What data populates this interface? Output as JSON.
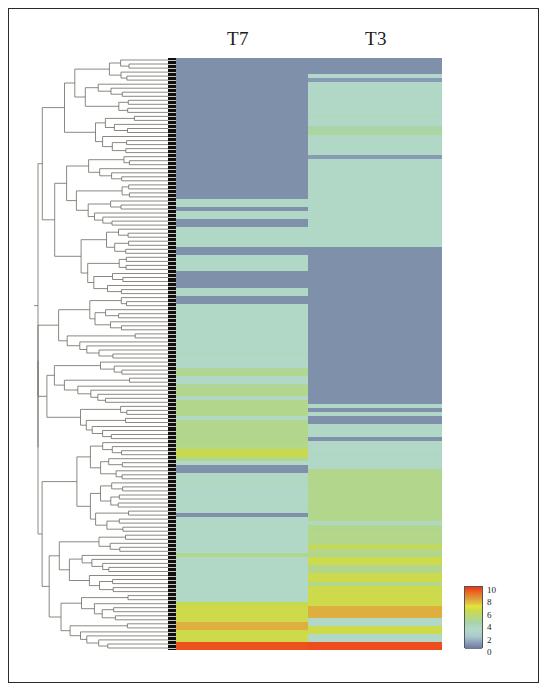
{
  "figure": {
    "type": "heatmap-with-dendrogram",
    "columns": [
      {
        "id": "t7",
        "label": "T7"
      },
      {
        "id": "t3",
        "label": "T3"
      }
    ]
  },
  "legend": {
    "title": "",
    "ticks": [
      "10",
      "8",
      "6",
      "4",
      "2",
      "0"
    ],
    "min": 0,
    "max": 10,
    "colors": [
      "#f03b18",
      "#f36a1e",
      "#e8962c",
      "#dcc33f",
      "#c9d94e",
      "#a9d48a",
      "#a8d9c6",
      "#b9dcd4",
      "#8fa2ba",
      "#6b7a99"
    ]
  },
  "chart_data": {
    "type": "heatmap",
    "title": "",
    "xlabel": "",
    "ylabel": "",
    "categories": [
      "T7",
      "T3"
    ],
    "colorbar": {
      "label": "",
      "min": 0,
      "max": 10,
      "ticks": [
        10,
        8,
        6,
        4,
        2,
        0
      ]
    },
    "grid": false,
    "legend_position": "bottom-right",
    "row_count": 148,
    "rows": [
      {
        "t7": 0.6,
        "t3": 0.6
      },
      {
        "t7": 0.6,
        "t3": 0.6
      },
      {
        "t7": 0.6,
        "t3": 0.6
      },
      {
        "t7": 0.6,
        "t3": 0.6
      },
      {
        "t7": 0.6,
        "t3": 3.0
      },
      {
        "t7": 0.6,
        "t3": 0.9
      },
      {
        "t7": 0.6,
        "t3": 3.2
      },
      {
        "t7": 0.6,
        "t3": 3.2
      },
      {
        "t7": 0.6,
        "t3": 3.2
      },
      {
        "t7": 0.6,
        "t3": 3.2
      },
      {
        "t7": 0.6,
        "t3": 3.2
      },
      {
        "t7": 0.6,
        "t3": 3.2
      },
      {
        "t7": 0.6,
        "t3": 3.2
      },
      {
        "t7": 0.6,
        "t3": 3.2
      },
      {
        "t7": 0.6,
        "t3": 3.4
      },
      {
        "t7": 0.6,
        "t3": 3.2
      },
      {
        "t7": 0.6,
        "t3": 3.2
      },
      {
        "t7": 0.6,
        "t3": 4.2
      },
      {
        "t7": 0.6,
        "t3": 4.4
      },
      {
        "t7": 0.6,
        "t3": 3.2
      },
      {
        "t7": 0.6,
        "t3": 3.2
      },
      {
        "t7": 0.6,
        "t3": 3.2
      },
      {
        "t7": 0.6,
        "t3": 3.2
      },
      {
        "t7": 0.6,
        "t3": 3.2
      },
      {
        "t7": 0.6,
        "t3": 0.9
      },
      {
        "t7": 0.6,
        "t3": 3.2
      },
      {
        "t7": 0.6,
        "t3": 3.2
      },
      {
        "t7": 0.6,
        "t3": 3.2
      },
      {
        "t7": 0.6,
        "t3": 3.2
      },
      {
        "t7": 0.6,
        "t3": 3.2
      },
      {
        "t7": 0.6,
        "t3": 3.2
      },
      {
        "t7": 0.6,
        "t3": 3.2
      },
      {
        "t7": 0.6,
        "t3": 3.2
      },
      {
        "t7": 0.6,
        "t3": 3.2
      },
      {
        "t7": 0.6,
        "t3": 3.2
      },
      {
        "t7": 3.2,
        "t3": 3.2
      },
      {
        "t7": 3.2,
        "t3": 3.2
      },
      {
        "t7": 0.6,
        "t3": 3.2
      },
      {
        "t7": 3.2,
        "t3": 3.2
      },
      {
        "t7": 3.2,
        "t3": 3.2
      },
      {
        "t7": 0.6,
        "t3": 3.2
      },
      {
        "t7": 0.6,
        "t3": 3.2
      },
      {
        "t7": 3.2,
        "t3": 3.2
      },
      {
        "t7": 3.2,
        "t3": 3.2
      },
      {
        "t7": 3.2,
        "t3": 3.2
      },
      {
        "t7": 3.2,
        "t3": 3.2
      },
      {
        "t7": 3.2,
        "t3": 3.2
      },
      {
        "t7": 0.6,
        "t3": 0.6
      },
      {
        "t7": 0.6,
        "t3": 0.6
      },
      {
        "t7": 3.2,
        "t3": 0.6
      },
      {
        "t7": 3.2,
        "t3": 0.6
      },
      {
        "t7": 3.2,
        "t3": 0.6
      },
      {
        "t7": 3.2,
        "t3": 0.6
      },
      {
        "t7": 0.6,
        "t3": 0.6
      },
      {
        "t7": 0.6,
        "t3": 0.6
      },
      {
        "t7": 0.6,
        "t3": 0.6
      },
      {
        "t7": 0.6,
        "t3": 0.6
      },
      {
        "t7": 3.2,
        "t3": 0.6
      },
      {
        "t7": 3.2,
        "t3": 0.6
      },
      {
        "t7": 0.6,
        "t3": 0.6
      },
      {
        "t7": 0.6,
        "t3": 0.6
      },
      {
        "t7": 3.2,
        "t3": 0.6
      },
      {
        "t7": 3.2,
        "t3": 0.6
      },
      {
        "t7": 3.2,
        "t3": 0.6
      },
      {
        "t7": 3.2,
        "t3": 0.6
      },
      {
        "t7": 3.2,
        "t3": 0.6
      },
      {
        "t7": 3.2,
        "t3": 0.6
      },
      {
        "t7": 3.2,
        "t3": 0.6
      },
      {
        "t7": 3.2,
        "t3": 0.6
      },
      {
        "t7": 3.2,
        "t3": 0.6
      },
      {
        "t7": 3.2,
        "t3": 0.6
      },
      {
        "t7": 3.2,
        "t3": 0.6
      },
      {
        "t7": 3.2,
        "t3": 0.6
      },
      {
        "t7": 3.4,
        "t3": 0.6
      },
      {
        "t7": 3.2,
        "t3": 0.6
      },
      {
        "t7": 3.2,
        "t3": 0.6
      },
      {
        "t7": 3.2,
        "t3": 0.6
      },
      {
        "t7": 4.6,
        "t3": 0.6
      },
      {
        "t7": 4.8,
        "t3": 0.6
      },
      {
        "t7": 3.2,
        "t3": 0.6
      },
      {
        "t7": 3.2,
        "t3": 0.6
      },
      {
        "t7": 4.6,
        "t3": 0.6
      },
      {
        "t7": 4.8,
        "t3": 0.6
      },
      {
        "t7": 4.8,
        "t3": 0.6
      },
      {
        "t7": 3.4,
        "t3": 0.6
      },
      {
        "t7": 4.8,
        "t3": 0.6
      },
      {
        "t7": 4.8,
        "t3": 3.2
      },
      {
        "t7": 4.8,
        "t3": 0.6
      },
      {
        "t7": 4.8,
        "t3": 3.2
      },
      {
        "t7": 3.2,
        "t3": 0.6
      },
      {
        "t7": 4.8,
        "t3": 0.6
      },
      {
        "t7": 4.8,
        "t3": 3.2
      },
      {
        "t7": 4.8,
        "t3": 3.2
      },
      {
        "t7": 4.8,
        "t3": 3.2
      },
      {
        "t7": 4.8,
        "t3": 0.6
      },
      {
        "t7": 4.8,
        "t3": 3.2
      },
      {
        "t7": 4.9,
        "t3": 3.2
      },
      {
        "t7": 6.2,
        "t3": 3.2
      },
      {
        "t7": 6.2,
        "t3": 3.4
      },
      {
        "t7": 4.8,
        "t3": 3.2
      },
      {
        "t7": 3.2,
        "t3": 3.2
      },
      {
        "t7": 0.6,
        "t3": 3.2
      },
      {
        "t7": 0.6,
        "t3": 4.8
      },
      {
        "t7": 3.2,
        "t3": 4.8
      },
      {
        "t7": 3.2,
        "t3": 4.8
      },
      {
        "t7": 3.4,
        "t3": 4.8
      },
      {
        "t7": 3.2,
        "t3": 4.8
      },
      {
        "t7": 3.2,
        "t3": 4.8
      },
      {
        "t7": 3.2,
        "t3": 4.8
      },
      {
        "t7": 3.2,
        "t3": 4.8
      },
      {
        "t7": 3.2,
        "t3": 4.8
      },
      {
        "t7": 3.4,
        "t3": 4.8
      },
      {
        "t7": 3.2,
        "t3": 4.8
      },
      {
        "t7": 0.6,
        "t3": 4.8
      },
      {
        "t7": 3.2,
        "t3": 4.8
      },
      {
        "t7": 3.2,
        "t3": 3.4
      },
      {
        "t7": 3.2,
        "t3": 4.8
      },
      {
        "t7": 3.2,
        "t3": 4.8
      },
      {
        "t7": 3.2,
        "t3": 4.9
      },
      {
        "t7": 3.2,
        "t3": 4.8
      },
      {
        "t7": 3.2,
        "t3": 4.8
      },
      {
        "t7": 3.2,
        "t3": 6.2
      },
      {
        "t7": 3.2,
        "t3": 4.8
      },
      {
        "t7": 4.8,
        "t3": 4.8
      },
      {
        "t7": 3.2,
        "t3": 6.3
      },
      {
        "t7": 3.2,
        "t3": 6.3
      },
      {
        "t7": 3.2,
        "t3": 4.8
      },
      {
        "t7": 3.2,
        "t3": 4.8
      },
      {
        "t7": 3.2,
        "t3": 6.3
      },
      {
        "t7": 3.2,
        "t3": 6.3
      },
      {
        "t7": 3.2,
        "t3": 4.8
      },
      {
        "t7": 3.2,
        "t3": 6.3
      },
      {
        "t7": 3.2,
        "t3": 6.3
      },
      {
        "t7": 3.2,
        "t3": 6.3
      },
      {
        "t7": 3.2,
        "t3": 6.3
      },
      {
        "t7": 6.2,
        "t3": 6.3
      },
      {
        "t7": 6.3,
        "t3": 7.8
      },
      {
        "t7": 6.3,
        "t3": 7.8
      },
      {
        "t7": 6.3,
        "t3": 7.8
      },
      {
        "t7": 6.3,
        "t3": 3.2
      },
      {
        "t7": 7.8,
        "t3": 3.2
      },
      {
        "t7": 7.8,
        "t3": 6.3
      },
      {
        "t7": 6.3,
        "t3": 6.3
      },
      {
        "t7": 6.3,
        "t3": 3.2
      },
      {
        "t7": 6.3,
        "t3": 3.2
      },
      {
        "t7": 9.6,
        "t3": 9.7
      },
      {
        "t7": 9.6,
        "t3": 9.7
      }
    ]
  }
}
